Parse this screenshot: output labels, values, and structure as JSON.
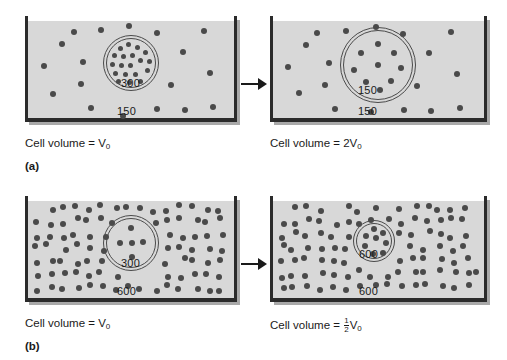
{
  "figure": {
    "colors": {
      "fluid": "#d8d8d8",
      "wall": "#2b2b2b",
      "particle": "#4a4a4a",
      "text": "#1a1a1a",
      "background": "#ffffff"
    }
  },
  "panels": [
    {
      "id": "a",
      "letter": "(a)",
      "arrow": "right-arrow",
      "before": {
        "caption_prefix": "Cell volume = ",
        "caption_value": "V",
        "caption_subscript": "0",
        "intracellular_label": "300",
        "extracellular_label": "150",
        "cell_state": "normal",
        "extracellular_density": "low"
      },
      "after": {
        "caption_prefix": "Cell volume = ",
        "caption_value": "2V",
        "caption_subscript": "0",
        "intracellular_label": "150",
        "extracellular_label": "150",
        "cell_state": "swollen",
        "extracellular_density": "low"
      }
    },
    {
      "id": "b",
      "letter": "(b)",
      "arrow": "right-arrow",
      "before": {
        "caption_prefix": "Cell volume = ",
        "caption_value": "V",
        "caption_subscript": "0",
        "intracellular_label": "300",
        "extracellular_label": "600",
        "cell_state": "normal",
        "extracellular_density": "high"
      },
      "after": {
        "caption_prefix": "Cell volume = ",
        "caption_fraction_numerator": "1",
        "caption_fraction_denominator": "2",
        "caption_value": "V",
        "caption_subscript": "0",
        "intracellular_label": "600",
        "extracellular_label": "600",
        "cell_state": "shrunken",
        "extracellular_density": "high"
      }
    }
  ],
  "chart_data": {
    "type": "diagram",
    "units": "mOsm/L",
    "panels": [
      {
        "id": "a",
        "label": "(a)",
        "description": "Hypotonic extracellular fluid causes cell swelling",
        "steps": [
          {
            "stage": "before",
            "intracellular_osmolarity": 300,
            "extracellular_osmolarity": 150,
            "cell_volume": "V0",
            "cell_volume_factor": 1.0,
            "cell_radius_px": 28,
            "extracellular_particle_count": 18,
            "intracellular_particle_count": 19
          },
          {
            "stage": "after",
            "intracellular_osmolarity": 150,
            "extracellular_osmolarity": 150,
            "cell_volume": "2V0",
            "cell_volume_factor": 2.0,
            "cell_radius_px": 38,
            "extracellular_particle_count": 18,
            "intracellular_particle_count": 9
          }
        ]
      },
      {
        "id": "b",
        "label": "(b)",
        "description": "Hypertonic extracellular fluid causes cell shrinkage",
        "steps": [
          {
            "stage": "before",
            "intracellular_osmolarity": 300,
            "extracellular_osmolarity": 600,
            "cell_volume": "V0",
            "cell_volume_factor": 1.0,
            "cell_radius_px": 28,
            "extracellular_particle_count": 128,
            "intracellular_particle_count": 5
          },
          {
            "stage": "after",
            "intracellular_osmolarity": 600,
            "extracellular_osmolarity": 600,
            "cell_volume": "1/2 V0",
            "cell_volume_factor": 0.5,
            "cell_radius_px": 21,
            "extracellular_particle_count": 128,
            "intracellular_particle_count": 8
          }
        ]
      }
    ]
  }
}
